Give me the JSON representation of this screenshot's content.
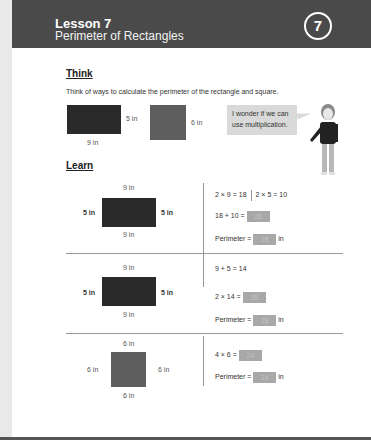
{
  "header": {
    "lesson_number": "Lesson 7",
    "lesson_title": "Perimeter of Rectangles",
    "badge": "7",
    "background_color": "#4a4a4a"
  },
  "think": {
    "title": "Think",
    "prompt": "Think of ways to calculate the perimeter of the rectangle and square.",
    "rectangle": {
      "width_label": "9 in",
      "height_label": "5 in",
      "color": "#2a2a2a"
    },
    "square": {
      "side_label": "6 in",
      "color": "#5e5e5e"
    },
    "speech_bubble": "I wonder if we can use multiplication."
  },
  "learn": {
    "title": "Learn",
    "rows": [
      {
        "shape": {
          "top": "9 in",
          "bottom": "9 in",
          "left": "5 in",
          "right": "5 in"
        },
        "line1_a": "2 × 9 = 18",
        "line1_b": "2 × 5 = 10",
        "line2": "18 + 10 =",
        "line2_answer": "28",
        "perimeter_label": "Perimeter =",
        "perimeter_answer": "28",
        "unit": "in"
      },
      {
        "shape": {
          "top": "9 in",
          "bottom": "9 in",
          "left": "5 in",
          "right": "5 in"
        },
        "line1": "9 + 5 = 14",
        "line2": "2 × 14 =",
        "line2_answer": "28",
        "perimeter_label": "Perimeter =",
        "perimeter_answer": "28",
        "unit": "in"
      },
      {
        "shape": {
          "top": "6 in",
          "bottom": "6 in",
          "left": "6 in",
          "right": "6 in"
        },
        "line1": "4 × 6 =",
        "line1_answer": "24",
        "perimeter_label": "Perimeter =",
        "perimeter_answer": "24",
        "unit": "in"
      }
    ]
  }
}
